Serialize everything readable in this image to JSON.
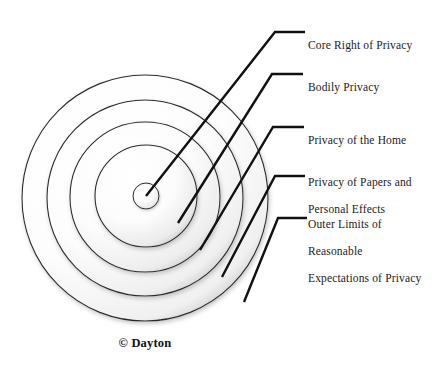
{
  "figure": {
    "type": "concentric-ring-diagram",
    "credit": "© Dayton",
    "background_color": "#ffffff",
    "ring_stroke_color": "#2b2b2b",
    "leader_color": "#111111",
    "text_color": "#1b1b1b"
  },
  "rings": [
    {
      "index": 0,
      "name": "core-right-of-privacy",
      "label": "Core Right of Privacy",
      "radius": 13,
      "center_x": 146,
      "center_y": 196
    },
    {
      "index": 1,
      "name": "bodily-privacy",
      "label": "Bodily Privacy",
      "radius": 51,
      "center_x": 146,
      "center_y": 196
    },
    {
      "index": 2,
      "name": "privacy-of-the-home",
      "label": "Privacy of the Home",
      "radius": 75,
      "center_x": 145,
      "center_y": 197
    },
    {
      "index": 3,
      "name": "privacy-of-papers-and-personal-effects",
      "label": "Privacy of Papers and Personal Effects",
      "radius": 98,
      "center_x": 145,
      "center_y": 198
    },
    {
      "index": 4,
      "name": "outer-limits-of-reasonable-expectations-of-privacy",
      "label": "Outer Limits of Reasonable Expectations of Privacy",
      "radius": 123,
      "center_x": 145,
      "center_y": 198
    }
  ],
  "labels": [
    {
      "id": "core-right-of-privacy",
      "lines": [
        "Core Right of Privacy"
      ],
      "x": 308,
      "y": 25
    },
    {
      "id": "bodily-privacy",
      "lines": [
        "Bodily Privacy"
      ],
      "x": 308,
      "y": 67
    },
    {
      "id": "privacy-of-the-home",
      "lines": [
        "Privacy of the Home"
      ],
      "x": 308,
      "y": 120
    },
    {
      "id": "privacy-of-papers-and-personal-effects",
      "lines": [
        "Privacy of Papers and",
        "Personal Effects"
      ],
      "x": 308,
      "y": 162
    },
    {
      "id": "outer-limits-of-reasonable-expectations-of-privacy",
      "lines": [
        "Outer Limits of",
        "Reasonable",
        "Expectations of Privacy"
      ],
      "x": 308,
      "y": 204
    }
  ],
  "leaders": [
    {
      "id": "leader-core-right-of-privacy",
      "points": "146,196 275,32 305,32"
    },
    {
      "id": "leader-bodily-privacy",
      "points": "178,223 272,74 303,74"
    },
    {
      "id": "leader-privacy-of-the-home",
      "points": "200,250 273,127 304,127"
    },
    {
      "id": "leader-privacy-of-papers",
      "points": "222,277 275,176 305,176"
    },
    {
      "id": "leader-outer-limits",
      "points": "244,302 278,218 307,218"
    }
  ]
}
